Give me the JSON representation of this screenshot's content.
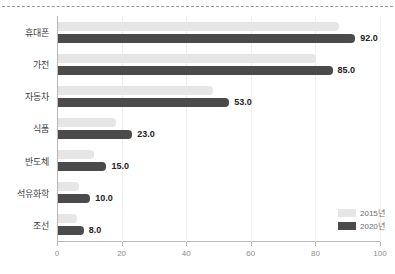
{
  "chart_data": {
    "type": "bar",
    "orientation": "horizontal",
    "title": "",
    "xlabel": "",
    "ylabel": "",
    "categories": [
      "휴대폰",
      "가전",
      "자동차",
      "식품",
      "반도체",
      "석유화학",
      "조선"
    ],
    "series": [
      {
        "name": "2015년",
        "color": "#e6e6e6",
        "values": [
          87.0,
          80.0,
          48.0,
          18.0,
          11.0,
          6.5,
          6.0
        ],
        "show_labels": false
      },
      {
        "name": "2020년",
        "color": "#4b4b4b",
        "values": [
          92.0,
          85.0,
          53.0,
          23.0,
          15.0,
          10.0,
          8.0
        ],
        "labels": [
          "92.0",
          "85.0",
          "53.0",
          "23.0",
          "15.0",
          "10.0",
          "8.0"
        ],
        "show_labels": true
      }
    ],
    "xlim": [
      0,
      100
    ],
    "xticks": [
      0,
      20,
      40,
      60,
      80,
      100
    ],
    "xtick_labels": [
      "0",
      "20",
      "40",
      "60",
      "80",
      "100"
    ],
    "grid": true,
    "legend_position": "bottom-right"
  },
  "legend": {
    "entries": [
      {
        "label": "2015년",
        "color": "#e6e6e6"
      },
      {
        "label": "2020년",
        "color": "#4b4b4b"
      }
    ]
  }
}
